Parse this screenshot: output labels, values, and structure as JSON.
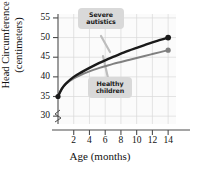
{
  "chart_data": {
    "type": "line",
    "title": "",
    "xlabel": "Age (months)",
    "ylabel": "Head Circumference (centimeters)",
    "ylabel_line1": "Head Circumference",
    "ylabel_line2": "(centimeters)",
    "xlim": [
      0,
      15
    ],
    "ylim": [
      28,
      56
    ],
    "yticks": [
      30,
      35,
      40,
      45,
      50,
      55
    ],
    "ytick_labels": [
      "30",
      "35",
      "40",
      "45",
      "50",
      "55"
    ],
    "xticks": [
      2,
      4,
      6,
      8,
      10,
      12,
      14
    ],
    "xtick_labels": [
      "2",
      "4",
      "6",
      "8",
      "10",
      "12",
      "14"
    ],
    "grid": true,
    "grid_color": "#d8d8d8",
    "axis_break": true,
    "legend": "callouts",
    "legend_position": "in-plot-callouts",
    "x": [
      0,
      0.5,
      1,
      2,
      3,
      4,
      5,
      6,
      7,
      8,
      9,
      10,
      11,
      12,
      13,
      14
    ],
    "series": [
      {
        "name": "Severe autistics",
        "color": "#1a1a1a",
        "marker_end": "dot",
        "values": [
          35.0,
          37.0,
          38.3,
          40.0,
          41.2,
          42.3,
          43.3,
          44.2,
          45.1,
          45.9,
          46.7,
          47.4,
          48.1,
          48.8,
          49.4,
          50.0
        ]
      },
      {
        "name": "Healthy children",
        "color": "#808080",
        "marker_end": "dot",
        "values": [
          35.0,
          37.0,
          38.2,
          39.6,
          40.6,
          41.4,
          42.1,
          42.7,
          43.3,
          43.8,
          44.3,
          44.8,
          45.3,
          45.8,
          46.3,
          46.8
        ]
      }
    ],
    "annotations": [
      {
        "id": "severe",
        "label_line1": "Severe",
        "label_line2": "autistics",
        "points_to_series": "Severe autistics"
      },
      {
        "id": "healthy",
        "label_line1": "Healthy",
        "label_line2": "children",
        "points_to_series": "Healthy children"
      }
    ]
  },
  "colors": {
    "severe_line": "#1a1a1a",
    "healthy_line": "#808080",
    "grid": "#d8d8d8",
    "axis": "#4d4d4d",
    "callout_bg": "#d9d9d9",
    "plot_bg": "#fbfbfb",
    "text": "#111111"
  }
}
